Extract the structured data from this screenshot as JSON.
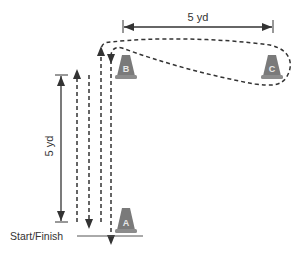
{
  "diagram": {
    "type": "drill-layout",
    "colors": {
      "line": "#333333",
      "cone_fill": "#7a7a7a",
      "cone_base": "#8c8c8c",
      "cone_letter": "#e8e8e8"
    },
    "labels": {
      "horizontal_distance": "5 yd",
      "vertical_distance": "5 yd",
      "start_finish": "Start/Finish"
    },
    "cones": [
      {
        "id": "A",
        "label": "A"
      },
      {
        "id": "B",
        "label": "B"
      },
      {
        "id": "C",
        "label": "C"
      }
    ]
  }
}
